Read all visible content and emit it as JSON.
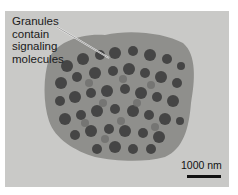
{
  "figure": {
    "annotation": {
      "lines": [
        "Granules",
        "contain",
        "signaling",
        "molecules"
      ]
    },
    "scale_bar": {
      "label": "1000 nm"
    },
    "colors": {
      "background": "#c9c9c7",
      "cell_body": "#8f8f8c",
      "granule_dark": "#3a3a3a",
      "granule_mid": "#6b6b69"
    }
  }
}
